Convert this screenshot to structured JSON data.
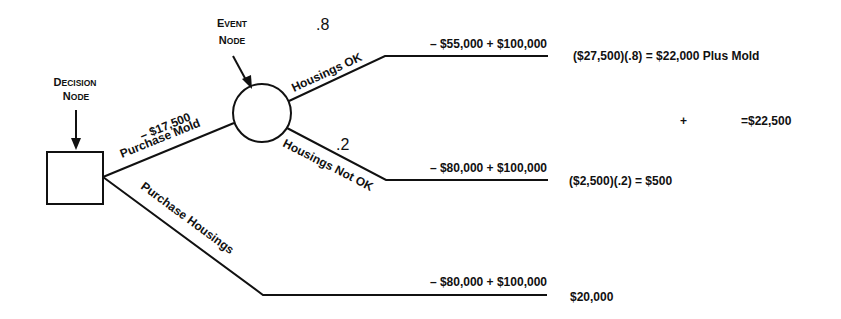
{
  "nodes": {
    "decision": {
      "label_line1_first": "D",
      "label_line1_rest": "ECISION",
      "label_line2_first": "N",
      "label_line2_rest": "ODE"
    },
    "event": {
      "label_line1_first": "E",
      "label_line1_rest": "VENT",
      "label_line2_first": "N",
      "label_line2_rest": "ODE"
    }
  },
  "branches": {
    "purchase_mold": {
      "cost": "– $17,500",
      "label": "Purchase Mold"
    },
    "purchase_housings": {
      "label": "Purchase Housings"
    },
    "housings_ok": {
      "probability": ".8",
      "label": "Housings OK",
      "payoff": "– $55,000  +  $100,000"
    },
    "housings_not_ok": {
      "probability": ".2",
      "label": "Housings Not OK",
      "payoff": "– $80,000  +  $100,000"
    },
    "housings_purchase": {
      "payoff": "– $80,000  +  $100,000"
    }
  },
  "results": {
    "ok_calc": "($27,500)(.8)  =  $22,000 Plus Mold",
    "plus": "+",
    "total": "=$22,500",
    "not_ok_calc": "($2,500)(.2)  =  $500",
    "housings_value": "$20,000"
  }
}
